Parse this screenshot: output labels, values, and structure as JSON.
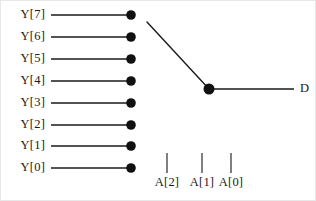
{
  "diagram": {
    "style": {
      "line_color": "#1a1a1a",
      "node_color": "#111111",
      "background": "#ffffff",
      "border_color": "#e8e8e8"
    },
    "inputs": [
      {
        "label": "Y[7]",
        "index": 7,
        "row_y": 14,
        "line_x1": 50,
        "line_x2": 130,
        "node_x": 130,
        "selected": true
      },
      {
        "label": "Y[6]",
        "index": 6,
        "row_y": 36,
        "line_x1": 50,
        "line_x2": 130,
        "node_x": 130,
        "selected": false
      },
      {
        "label": "Y[5]",
        "index": 5,
        "row_y": 58,
        "line_x1": 50,
        "line_x2": 130,
        "node_x": 130,
        "selected": false
      },
      {
        "label": "Y[4]",
        "index": 4,
        "row_y": 80,
        "line_x1": 50,
        "line_x2": 130,
        "node_x": 130,
        "selected": false
      },
      {
        "label": "Y[3]",
        "index": 3,
        "row_y": 102,
        "line_x1": 50,
        "line_x2": 130,
        "node_x": 130,
        "selected": false
      },
      {
        "label": "Y[2]",
        "index": 2,
        "row_y": 124,
        "line_x1": 50,
        "line_x2": 130,
        "node_x": 130,
        "selected": false
      },
      {
        "label": "Y[1]",
        "index": 1,
        "row_y": 145,
        "line_x1": 50,
        "line_x2": 130,
        "node_x": 130,
        "selected": false
      },
      {
        "label": "Y[0]",
        "index": 0,
        "row_y": 167,
        "line_x1": 50,
        "line_x2": 130,
        "node_x": 130,
        "selected": false
      }
    ],
    "switch_arm": {
      "from_x": 146,
      "from_y": 21,
      "to_x": 208,
      "to_y": 88
    },
    "pivot": {
      "node_x": 208,
      "node_y": 88,
      "radius": 5.5
    },
    "output": {
      "label": "D",
      "line_x1": 208,
      "line_x2": 293,
      "line_y": 88
    },
    "select_lines": [
      {
        "label": "A[2]",
        "tick_x": 166,
        "tick_y1": 152,
        "tick_y2": 172,
        "label_left": 149,
        "label_top": 175
      },
      {
        "label": "A[1]",
        "tick_x": 201,
        "tick_y1": 152,
        "tick_y2": 172,
        "label_left": 184,
        "label_top": 175
      },
      {
        "label": "A[0]",
        "tick_x": 230,
        "tick_y1": 152,
        "tick_y2": 172,
        "label_left": 213,
        "label_top": 175
      }
    ]
  }
}
